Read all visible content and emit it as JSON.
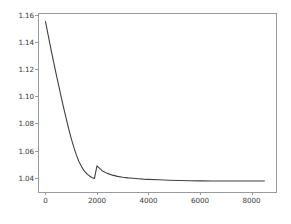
{
  "chart_data": {
    "type": "line",
    "title": "",
    "xlabel": "",
    "ylabel": "",
    "xlim": [
      -250,
      8950
    ],
    "ylim": [
      1.0295,
      1.1605
    ],
    "grid": false,
    "legend": "none",
    "line_color": "#404040",
    "background_color": "#ffffff",
    "frame_color": "#9a9a9a",
    "xticks": [
      0,
      2000,
      4000,
      6000,
      8000
    ],
    "xtick_labels": [
      "0",
      "2000",
      "4000",
      "6000",
      "8000"
    ],
    "yticks": [
      1.04,
      1.06,
      1.08,
      1.1,
      1.12,
      1.14,
      1.16
    ],
    "ytick_labels": [
      "1.04",
      "1.06",
      "1.08",
      "1.10",
      "1.12",
      "1.14",
      "1.16"
    ],
    "series": [
      {
        "name": "loss",
        "x": [
          0,
          100,
          200,
          300,
          400,
          500,
          600,
          700,
          800,
          900,
          1000,
          1100,
          1200,
          1300,
          1400,
          1500,
          1600,
          1700,
          1800,
          1900,
          2000,
          2200,
          2400,
          2600,
          2800,
          3000,
          3200,
          3400,
          3600,
          3800,
          4000,
          4400,
          4800,
          5200,
          5600,
          6000,
          6500,
          7000,
          7500,
          8000,
          8500
        ],
        "y": [
          1.155,
          1.1455,
          1.136,
          1.1268,
          1.1178,
          1.109,
          1.1004,
          1.092,
          1.084,
          1.0762,
          1.069,
          1.0625,
          1.0568,
          1.052,
          1.0482,
          1.0452,
          1.043,
          1.0414,
          1.0402,
          1.0394,
          1.0487,
          1.0452,
          1.0432,
          1.0419,
          1.041,
          1.0404,
          1.0399,
          1.0396,
          1.0393,
          1.039,
          1.0388,
          1.0385,
          1.0382,
          1.038,
          1.0378,
          1.0377,
          1.0376,
          1.0376,
          1.0376,
          1.0376,
          1.0376
        ]
      }
    ]
  }
}
